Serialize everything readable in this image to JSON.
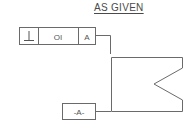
{
  "title": "AS GIVEN",
  "feature_control_frame": {
    "symbol": "⊥",
    "symbol_name": "perpendicularity",
    "tolerance": "OI",
    "datum_reference": "A"
  },
  "datum_feature": {
    "label": "-A-"
  },
  "colors": {
    "line": "#6a6a6a",
    "text": "#555555"
  }
}
